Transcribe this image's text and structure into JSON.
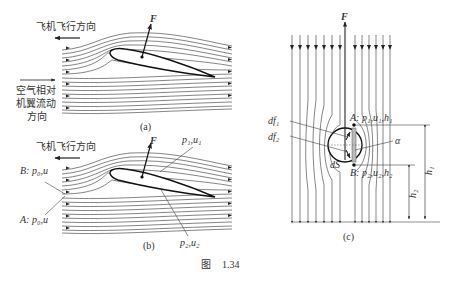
{
  "figure": {
    "caption_prefix": "图",
    "caption_number": "1.34"
  },
  "panel_a": {
    "label": "(a)",
    "flight_direction": "飞机飞行方向",
    "airflow_label_line1": "空气相对",
    "airflow_label_line2": "机翼流动",
    "airflow_label_line3": "方向",
    "force_label": "F"
  },
  "panel_b": {
    "label": "(b)",
    "flight_direction": "飞机飞行方向",
    "force_label": "F",
    "point_b": "B: p₀,u",
    "point_a": "A: p₀,u",
    "upper_surface": "p₁,u₁",
    "lower_surface": "p₂,u₂"
  },
  "panel_c": {
    "label": "(c)",
    "force_label": "F",
    "df1": "df₁",
    "df2": "df₂",
    "ds": "dS",
    "alpha": "α",
    "point_a": "A: p₁,u₁,h₁",
    "point_b": "B: p₂,u₂,h₂",
    "h1": "h₁",
    "h2": "h₂"
  }
}
